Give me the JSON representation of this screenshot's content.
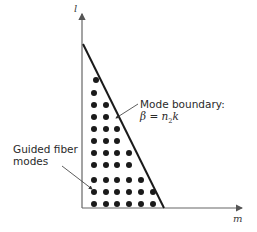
{
  "diagram": {
    "axes": {
      "x_label": "m",
      "y_label": "l",
      "color": "#555555"
    },
    "boundary": {
      "label_line1": "Mode boundary:",
      "label_formula_beta": "β",
      "label_formula_eq": " = ",
      "label_formula_n": "n",
      "label_formula_sub": "2",
      "label_formula_k": "k",
      "color": "#1a1a1a"
    },
    "guided_modes": {
      "label_line1": "Guided fiber",
      "label_line2": "modes",
      "dot_color": "#1a1a1a",
      "row_counts_top_to_bottom": [
        1,
        1,
        2,
        2,
        3,
        3,
        4,
        4,
        5,
        6,
        6
      ]
    }
  }
}
